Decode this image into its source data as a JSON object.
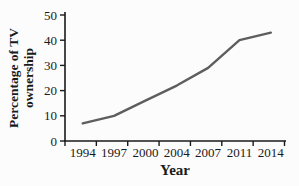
{
  "chart": {
    "background": "#fcfcfc",
    "axis_color": "#1a1a1a",
    "line_color": "#5e5e5e",
    "text_color": "#1a1a1a"
  },
  "chart_data": {
    "type": "line",
    "title": "",
    "xlabel": "Year",
    "ylabel": "Percentage of TV ownership",
    "ylabel_lines": [
      "Percentage of TV",
      "ownership"
    ],
    "categories": [
      "1994",
      "1997",
      "2000",
      "2004",
      "2007",
      "2011",
      "2014"
    ],
    "values": [
      7,
      10,
      16,
      22,
      29,
      40,
      43
    ],
    "ylim": [
      0,
      50
    ],
    "yticks": [
      0,
      10,
      20,
      30,
      40,
      50
    ],
    "grid": false,
    "legend_position": "none"
  }
}
